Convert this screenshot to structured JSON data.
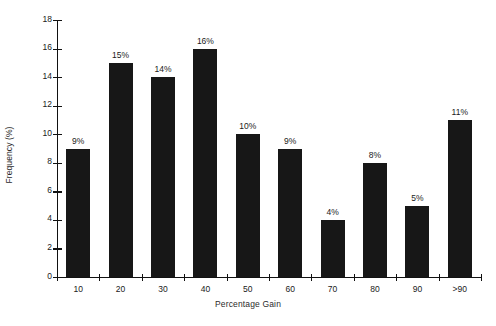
{
  "chart_data": {
    "type": "bar",
    "title": "",
    "xlabel": "Percentage Gain",
    "ylabel": "Frequency (%)",
    "categories": [
      "10",
      "20",
      "30",
      "40",
      "50",
      "60",
      "70",
      "80",
      "90",
      ">90"
    ],
    "values": [
      9,
      15,
      14,
      16,
      10,
      9,
      4,
      8,
      5,
      11
    ],
    "data_labels": [
      "9%",
      "15%",
      "14%",
      "16%",
      "10%",
      "9%",
      "4%",
      "8%",
      "5%",
      "11%"
    ],
    "ylim": [
      0,
      18
    ],
    "ytick_labels": [
      "0",
      "2",
      "4",
      "6",
      "8",
      "10",
      "12",
      "14",
      "16",
      "18"
    ],
    "ytick_values": [
      0,
      2,
      4,
      6,
      8,
      10,
      12,
      14,
      16,
      18
    ],
    "grid": false,
    "legend": null,
    "bar_color": "#171717",
    "axis_color": "#111111",
    "background_color": "#ffffff"
  }
}
